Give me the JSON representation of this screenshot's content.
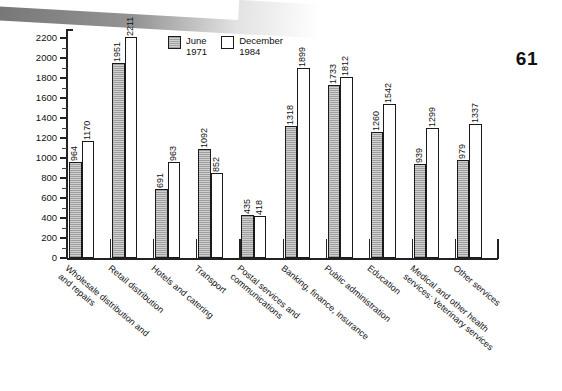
{
  "page": {
    "page_number": "61"
  },
  "legend": {
    "position": "inside-top-center",
    "items": [
      {
        "name": "june-1971",
        "label": "June\n1971",
        "swatch": "grey-hatched"
      },
      {
        "name": "december-1984",
        "label": "December\n1984",
        "swatch": "white"
      }
    ]
  },
  "chart_data": {
    "type": "bar",
    "title": "",
    "subtitle": "",
    "xlabel": "",
    "ylabel": "",
    "ylim": [
      0,
      2250
    ],
    "grid": false,
    "legend_position": "inside-top-center",
    "ytick_labels": [
      "0",
      "200",
      "400",
      "600",
      "800",
      "1000",
      "1200",
      "1400",
      "1600",
      "1800",
      "2000",
      "2200"
    ],
    "ytick_values": [
      0,
      200,
      400,
      600,
      800,
      1000,
      1200,
      1400,
      1600,
      1800,
      2000,
      2200
    ],
    "minor_tick_step": 100,
    "categories": [
      "Wholesale distribution and\nand repairs",
      "Retail distribution",
      "Hotels and catering",
      "Transport",
      "Postal services and\ncommunications",
      "Banking, finance, insurance",
      "Public administration",
      "Education",
      "Medical and other health\nservices:  Veterinary services",
      "Other services"
    ],
    "series": [
      {
        "name": "June\n1971",
        "short_name": "June 1971",
        "values": [
          964,
          1951,
          691,
          1092,
          435,
          1318,
          1733,
          1260,
          939,
          979
        ]
      },
      {
        "name": "December\n1984",
        "short_name": "December 1984",
        "values": [
          1170,
          2211,
          963,
          852,
          418,
          1899,
          1812,
          1542,
          1299,
          1337
        ]
      }
    ]
  },
  "colors": {
    "june_fill": "#cfcfcf",
    "december_fill": "#ffffff",
    "outline": "#1a1a1a",
    "text": "#111111",
    "scan_band": "#6e6e6e"
  }
}
